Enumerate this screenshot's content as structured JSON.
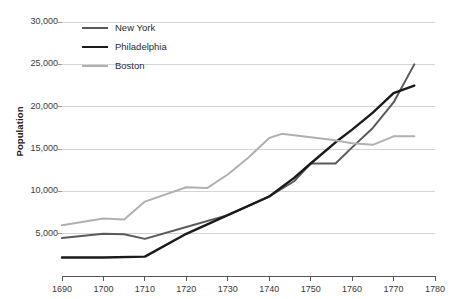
{
  "chart_data": {
    "type": "line",
    "title": "",
    "xlabel": "",
    "ylabel": "Population",
    "xlim": [
      1690,
      1780
    ],
    "ylim": [
      0,
      30000
    ],
    "xticks": [
      1690,
      1700,
      1710,
      1720,
      1730,
      1740,
      1750,
      1760,
      1770,
      1780
    ],
    "xtick_labels": [
      "1690",
      "1700",
      "1710",
      "1720",
      "1730",
      "1740",
      "1750",
      "1760",
      "1770",
      "1780"
    ],
    "yticks": [
      5000,
      10000,
      15000,
      20000,
      25000,
      30000
    ],
    "ytick_labels": [
      "5,000",
      "10,000",
      "15,000",
      "20,000",
      "25,000",
      "30,000"
    ],
    "grid": true,
    "grid_axis": "y",
    "legend_position": "top-left",
    "series": [
      {
        "name": "New York",
        "color": "#5a5a5a",
        "width": 2.0,
        "x": [
          1690,
          1700,
          1705,
          1710,
          1720,
          1730,
          1740,
          1746,
          1750,
          1756,
          1760,
          1765,
          1770,
          1775
        ],
        "values": [
          4500,
          5000,
          4950,
          4400,
          5800,
          7200,
          9400,
          11200,
          13300,
          13300,
          15200,
          17500,
          20500,
          25000
        ]
      },
      {
        "name": "Philadelphia",
        "color": "#1a1a1a",
        "width": 2.4,
        "x": [
          1690,
          1700,
          1710,
          1720,
          1730,
          1740,
          1746,
          1750,
          1756,
          1760,
          1765,
          1770,
          1775
        ],
        "values": [
          2200,
          2200,
          2300,
          5000,
          7200,
          9400,
          11600,
          13300,
          15800,
          17300,
          19300,
          21600,
          22500
        ]
      },
      {
        "name": "Boston",
        "color": "#b0b0b0",
        "width": 2.0,
        "x": [
          1690,
          1700,
          1705,
          1710,
          1720,
          1725,
          1730,
          1735,
          1740,
          1743,
          1750,
          1755,
          1760,
          1765,
          1770,
          1775
        ],
        "values": [
          6000,
          6800,
          6700,
          8800,
          10500,
          10400,
          12000,
          14000,
          16300,
          16800,
          16400,
          16100,
          15700,
          15500,
          16500,
          16500
        ]
      }
    ]
  },
  "axes": {
    "y_title": "Population"
  },
  "legend": {
    "items": [
      {
        "label": "New York",
        "color": "#5a5a5a"
      },
      {
        "label": "Philadelphia",
        "color": "#1a1a1a"
      },
      {
        "label": "Boston",
        "color": "#b0b0b0"
      }
    ]
  }
}
